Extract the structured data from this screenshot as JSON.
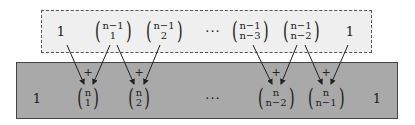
{
  "top_row": [
    {
      "type": "one",
      "text": "1",
      "x": 61,
      "y": 31
    },
    {
      "type": "binom",
      "top": "n−1",
      "bottom": "1",
      "x": 113,
      "y": 31
    },
    {
      "type": "binom",
      "top": "n−1",
      "bottom": "2",
      "x": 164,
      "y": 31
    },
    {
      "type": "dots",
      "text": "···",
      "x": 213,
      "y": 31
    },
    {
      "type": "binom",
      "top": "n−1",
      "bottom": "n−3",
      "x": 250,
      "y": 31
    },
    {
      "type": "binom",
      "top": "n−1",
      "bottom": "n−2",
      "x": 301,
      "y": 31
    },
    {
      "type": "one",
      "text": "1",
      "x": 350,
      "y": 31
    }
  ],
  "bottom_row": [
    {
      "type": "one",
      "text": "1",
      "x": 37,
      "y": 98
    },
    {
      "type": "binom",
      "top": "n",
      "bottom": "1",
      "x": 88,
      "y": 98
    },
    {
      "type": "binom",
      "top": "n",
      "bottom": "2",
      "x": 139,
      "y": 98
    },
    {
      "type": "dots",
      "text": "···",
      "x": 213,
      "y": 98
    },
    {
      "type": "binom",
      "top": "n",
      "bottom": "n−2",
      "x": 276,
      "y": 98
    },
    {
      "type": "binom",
      "top": "n",
      "bottom": "n−1",
      "x": 326,
      "y": 98
    },
    {
      "type": "one",
      "text": "1",
      "x": 377,
      "y": 98
    }
  ],
  "plus_signs": [
    {
      "text": "+",
      "x": 88,
      "y": 72
    },
    {
      "text": "+",
      "x": 139,
      "y": 72
    },
    {
      "text": "+",
      "x": 276,
      "y": 72
    },
    {
      "text": "+",
      "x": 326,
      "y": 72
    }
  ],
  "arrows": [
    {
      "x1": 67,
      "y1": 45,
      "x2": 84,
      "y2": 84
    },
    {
      "x1": 110,
      "y1": 45,
      "x2": 93,
      "y2": 84
    },
    {
      "x1": 117,
      "y1": 45,
      "x2": 134,
      "y2": 84
    },
    {
      "x1": 160,
      "y1": 45,
      "x2": 144,
      "y2": 84
    },
    {
      "x1": 253,
      "y1": 45,
      "x2": 272,
      "y2": 84
    },
    {
      "x1": 297,
      "y1": 45,
      "x2": 281,
      "y2": 84
    },
    {
      "x1": 305,
      "y1": 45,
      "x2": 322,
      "y2": 84
    },
    {
      "x1": 348,
      "y1": 45,
      "x2": 331,
      "y2": 84
    }
  ],
  "colors": {
    "top_box": "#efefef",
    "bottom_box": "#a9a9a9",
    "arrow": "#222222"
  }
}
